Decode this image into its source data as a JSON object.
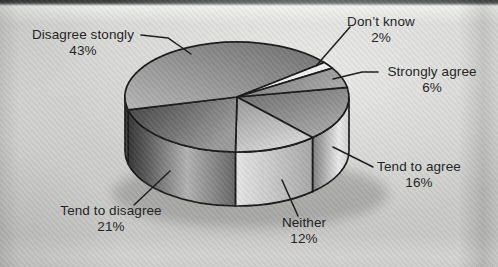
{
  "chart_data": {
    "type": "pie",
    "style": "3d-cylinder",
    "title": "",
    "unit": "%",
    "colors": {
      "background": "#cfd0cd",
      "outline": "#1a1a1a",
      "label_text": "#222222"
    },
    "slices": [
      {
        "id": "tend-to-agree",
        "label": "Tend to agree",
        "pct_label": "16%",
        "value": 16,
        "top_gradient": {
          "dir": [
            0,
            0,
            0.8,
            1
          ],
          "stops": [
            [
              "0%",
              "#6a6a6a"
            ],
            [
              "100%",
              "#ababab"
            ]
          ]
        },
        "side_gradient": {
          "dir": [
            0,
            0,
            1,
            0
          ],
          "stops": [
            [
              "0%",
              "#7e7e7e"
            ],
            [
              "72%",
              "#eaeaea"
            ],
            [
              "100%",
              "#d2d2d2"
            ]
          ]
        }
      },
      {
        "id": "neither",
        "label": "Neither",
        "pct_label": "12%",
        "value": 12,
        "top_gradient": {
          "dir": [
            0,
            0,
            0.5,
            1
          ],
          "stops": [
            [
              "0%",
              "#989898"
            ],
            [
              "100%",
              "#d6d6d6"
            ]
          ]
        },
        "side_gradient": {
          "dir": [
            0,
            0,
            1,
            0
          ],
          "stops": [
            [
              "0%",
              "#e6e6e6"
            ],
            [
              "100%",
              "#a8a8a8"
            ]
          ]
        }
      },
      {
        "id": "tend-to-disagree",
        "label": "Tend to disagree",
        "pct_label": "21%",
        "value": 21,
        "top_gradient": {
          "dir": [
            0,
            0,
            1,
            0.5
          ],
          "stops": [
            [
              "0%",
              "#3f3f3f"
            ],
            [
              "100%",
              "#9a9a9a"
            ]
          ]
        },
        "side_gradient": {
          "dir": [
            0,
            0,
            1,
            0
          ],
          "stops": [
            [
              "0%",
              "#353535"
            ],
            [
              "15%",
              "#565656"
            ],
            [
              "55%",
              "#b2b2b2"
            ],
            [
              "100%",
              "#666666"
            ]
          ]
        }
      },
      {
        "id": "disagree-stongly",
        "label": "Disagree stongly",
        "pct_label": "43%",
        "value": 43,
        "top_gradient": {
          "dir": [
            1,
            0,
            0,
            1
          ],
          "stops": [
            [
              "0%",
              "#6e6e6e"
            ],
            [
              "100%",
              "#b6b6b6"
            ]
          ]
        },
        "side_gradient": {
          "dir": [
            0,
            0,
            0,
            1
          ],
          "stops": [
            [
              "0%",
              "#2c2c2c"
            ],
            [
              "100%",
              "#565656"
            ]
          ]
        }
      },
      {
        "id": "dont-know",
        "label": "Don’t know",
        "pct_label": "2%",
        "value": 2,
        "top_gradient": {
          "dir": [
            0,
            0,
            1,
            1
          ],
          "stops": [
            [
              "0%",
              "#e0e0e0"
            ],
            [
              "100%",
              "#ffffff"
            ]
          ]
        }
      },
      {
        "id": "strongly-agree",
        "label": "Strongly agree",
        "pct_label": "6%",
        "value": 6,
        "top_gradient": {
          "dir": [
            0,
            0,
            1,
            0.3
          ],
          "stops": [
            [
              "0%",
              "#787878"
            ],
            [
              "100%",
              "#a6a6a6"
            ]
          ]
        }
      }
    ]
  }
}
